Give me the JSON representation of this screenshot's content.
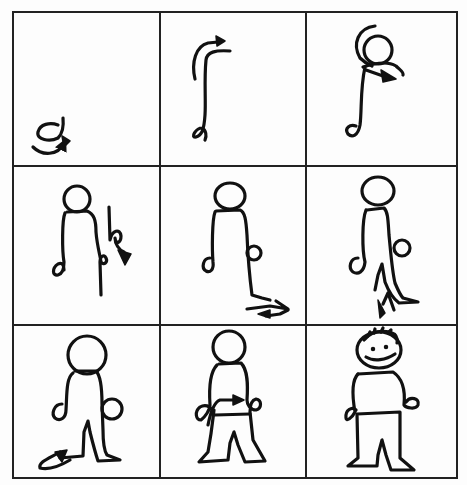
{
  "title": "How to draw a stick figure in 9 steps",
  "grid": {
    "rows": 3,
    "cols": 3
  },
  "panels": [
    {
      "step": 1,
      "description": "Start with a small curl for the hand with an arrow showing stroke direction"
    },
    {
      "step": 2,
      "description": "Draw a long S-shaped line for the side of the body with arrow at top"
    },
    {
      "step": 3,
      "description": "Add a circle for the head with arrow continuing across the shoulder"
    },
    {
      "step": 4,
      "description": "Draw the other side of the body down with a curl for the second hand"
    },
    {
      "step": 5,
      "description": "Continue the body line down and add a foot with arrow"
    },
    {
      "step": 6,
      "description": "Draw the inside of the leg up with arrow"
    },
    {
      "step": 7,
      "description": "Draw the second leg and foot with arrow"
    },
    {
      "step": 8,
      "description": "Draw the waist line across the body with arrow"
    },
    {
      "step": 9,
      "description": "Finished figure with smiling face and hair"
    }
  ],
  "colors": {
    "ink": "#111111",
    "paper": "#fdfdfd",
    "grid": "#222222"
  }
}
